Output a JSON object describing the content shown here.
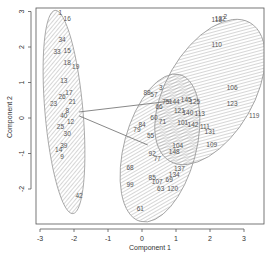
{
  "chart_data": {
    "type": "scatter",
    "title": "",
    "xlabel": "Component 1",
    "ylabel": "Component 2",
    "xlim": [
      -3.1,
      3.6
    ],
    "ylim": [
      -2.95,
      3.1
    ],
    "grid": false,
    "x_ticks": [
      "-3",
      "-2",
      "-1",
      "0",
      "1",
      "2",
      "3"
    ],
    "y_ticks": [
      "-2",
      "-1",
      "0",
      "1",
      "2",
      "3"
    ],
    "clusters": [
      {
        "name": "cluster-1",
        "center": [
          -2.3,
          0.17
        ],
        "ellipse": {
          "cx": 64,
          "cy": 112,
          "rx": 19,
          "ry": 102,
          "rotate": -5
        },
        "points": [
          {
            "label": "1",
            "x": -2.4,
            "y": 2.95
          },
          {
            "label": "16",
            "x": -2.2,
            "y": 2.8
          },
          {
            "label": "34",
            "x": -2.35,
            "y": 2.2
          },
          {
            "label": "33",
            "x": -2.5,
            "y": 1.85
          },
          {
            "label": "15",
            "x": -2.2,
            "y": 1.9
          },
          {
            "label": "18",
            "x": -2.2,
            "y": 1.55
          },
          {
            "label": "19",
            "x": -1.95,
            "y": 1.45
          },
          {
            "label": "13",
            "x": -2.3,
            "y": 1.05
          },
          {
            "label": "26",
            "x": -2.35,
            "y": 0.6
          },
          {
            "label": "23",
            "x": -2.6,
            "y": 0.4
          },
          {
            "label": "17",
            "x": -2.15,
            "y": 0.7
          },
          {
            "label": "21",
            "x": -2.05,
            "y": 0.45
          },
          {
            "label": "8",
            "x": -2.2,
            "y": 0.2
          },
          {
            "label": "40",
            "x": -2.3,
            "y": 0.05
          },
          {
            "label": "12",
            "x": -2.1,
            "y": -0.1
          },
          {
            "label": "25",
            "x": -2.4,
            "y": -0.25
          },
          {
            "label": "30",
            "x": -2.2,
            "y": -0.45
          },
          {
            "label": "14",
            "x": -2.45,
            "y": -0.9
          },
          {
            "label": "39",
            "x": -2.3,
            "y": -0.8
          },
          {
            "label": "9",
            "x": -2.35,
            "y": -1.1
          },
          {
            "label": "42",
            "x": -1.85,
            "y": -2.2
          }
        ]
      },
      {
        "name": "cluster-2",
        "center": [
          0.45,
          -0.85
        ],
        "ellipse": {
          "cx": 160,
          "cy": 148,
          "rx": 36,
          "ry": 76,
          "rotate": 15
        },
        "points": [
          {
            "label": "3",
            "x": 0.55,
            "y": 0.85
          },
          {
            "label": "88",
            "x": 0.15,
            "y": 0.7
          },
          {
            "label": "57",
            "x": 0.35,
            "y": 0.65
          },
          {
            "label": "75",
            "x": 0.7,
            "y": 0.45
          },
          {
            "label": "66",
            "x": 0.5,
            "y": 0.3
          },
          {
            "label": "60",
            "x": 0.35,
            "y": 0.0
          },
          {
            "label": "71",
            "x": 0.6,
            "y": -0.1
          },
          {
            "label": "84",
            "x": 0.0,
            "y": -0.2
          },
          {
            "label": "79",
            "x": -0.15,
            "y": -0.35
          },
          {
            "label": "55",
            "x": 0.25,
            "y": -0.5
          },
          {
            "label": "104",
            "x": 1.05,
            "y": -0.8
          },
          {
            "label": "148",
            "x": 0.95,
            "y": -0.95
          },
          {
            "label": "92",
            "x": 0.3,
            "y": -1.0
          },
          {
            "label": "77",
            "x": 0.45,
            "y": -1.15
          },
          {
            "label": "137",
            "x": 1.1,
            "y": -1.45
          },
          {
            "label": "134",
            "x": 0.95,
            "y": -1.6
          },
          {
            "label": "68",
            "x": -0.35,
            "y": -1.4
          },
          {
            "label": "85",
            "x": 0.3,
            "y": -1.7
          },
          {
            "label": "107",
            "x": 0.45,
            "y": -1.8
          },
          {
            "label": "99",
            "x": -0.35,
            "y": -1.9
          },
          {
            "label": "63",
            "x": 0.55,
            "y": -2.0
          },
          {
            "label": "69",
            "x": 0.8,
            "y": -1.75
          },
          {
            "label": "120",
            "x": 0.9,
            "y": -2.0
          },
          {
            "label": "61",
            "x": -0.05,
            "y": -2.55
          }
        ]
      },
      {
        "name": "cluster-3",
        "center": [
          2.0,
          0.75
        ],
        "ellipse": {
          "cx": 210,
          "cy": 92,
          "rx": 44,
          "ry": 80,
          "rotate": 30
        },
        "points": [
          {
            "label": "118",
            "x": 2.2,
            "y": 2.75
          },
          {
            "label": "132",
            "x": 2.3,
            "y": 2.8
          },
          {
            "label": "2",
            "x": 2.45,
            "y": 2.85
          },
          {
            "label": "110",
            "x": 2.2,
            "y": 2.05
          },
          {
            "label": "144",
            "x": 0.95,
            "y": 0.45
          },
          {
            "label": "145",
            "x": 1.3,
            "y": 0.5
          },
          {
            "label": "125",
            "x": 1.55,
            "y": 0.45
          },
          {
            "label": "121",
            "x": 1.1,
            "y": 0.2
          },
          {
            "label": "140",
            "x": 1.35,
            "y": 0.15
          },
          {
            "label": "113",
            "x": 1.7,
            "y": 0.1
          },
          {
            "label": "101",
            "x": 1.2,
            "y": -0.15
          },
          {
            "label": "142",
            "x": 1.5,
            "y": -0.2
          },
          {
            "label": "111",
            "x": 1.85,
            "y": -0.25
          },
          {
            "label": "131",
            "x": 2.0,
            "y": -0.4
          },
          {
            "label": "106",
            "x": 2.65,
            "y": 0.85
          },
          {
            "label": "123",
            "x": 2.65,
            "y": 0.4
          },
          {
            "label": "119",
            "x": 3.3,
            "y": 0.05
          },
          {
            "label": "109",
            "x": 2.05,
            "y": -0.75
          }
        ]
      }
    ],
    "connector_lines": [
      {
        "from": [
          -1.85,
          0.17
        ],
        "to": [
          0.88,
          0.48
        ]
      },
      {
        "from": [
          -1.85,
          0.06
        ],
        "to": [
          0.17,
          -0.76
        ]
      }
    ]
  }
}
